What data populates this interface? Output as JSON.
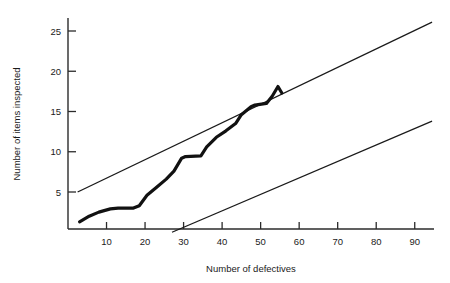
{
  "chart_data": {
    "type": "line",
    "title": "",
    "xlabel": "Number of defectives",
    "ylabel": "Number of items inspected",
    "xlim": [
      0,
      95
    ],
    "ylim": [
      0,
      27
    ],
    "xticks": [
      10,
      20,
      30,
      40,
      50,
      60,
      70,
      80,
      90
    ],
    "yticks": [
      5,
      10,
      15,
      20,
      25
    ],
    "grid": false,
    "legend": "none",
    "series": [
      {
        "name": "upper decision line",
        "style": "thin-straight",
        "x": [
          2.5,
          94.5
        ],
        "values": [
          5.0,
          26.1
        ]
      },
      {
        "name": "lower decision line",
        "style": "thin-straight",
        "x": [
          27.0,
          94.5
        ],
        "values": [
          0.0,
          13.8
        ]
      },
      {
        "name": "cumulative sample path",
        "style": "thick-staircase",
        "x": [
          3.0,
          5.5,
          8.0,
          11.0,
          13.0,
          17.0,
          18.5,
          20.5,
          23.0,
          25.5,
          27.5,
          29.5,
          30.5,
          34.5,
          36.0,
          38.5,
          41.0,
          43.5,
          45.0,
          47.5,
          48.5,
          51.5,
          53.0,
          54.5,
          55.5
        ],
        "values": [
          1.3,
          2.0,
          2.5,
          2.9,
          3.0,
          3.0,
          3.3,
          4.6,
          5.6,
          6.6,
          7.6,
          9.2,
          9.4,
          9.5,
          10.6,
          11.8,
          12.6,
          13.5,
          14.6,
          15.6,
          15.8,
          16.0,
          16.9,
          18.1,
          17.3
        ]
      }
    ]
  },
  "axes": {
    "x_tick_labels": [
      "10",
      "20",
      "30",
      "40",
      "50",
      "60",
      "70",
      "80",
      "90"
    ],
    "y_tick_labels": [
      "5",
      "10",
      "15",
      "20",
      "25"
    ],
    "x_title": "Number of defectives",
    "y_title": "Number of items inspected"
  },
  "colors": {
    "background": "#ffffff",
    "axis": "#2b2b2b",
    "line": "#1a1a1a",
    "path": "#111111",
    "text": "#1a1a1a"
  }
}
